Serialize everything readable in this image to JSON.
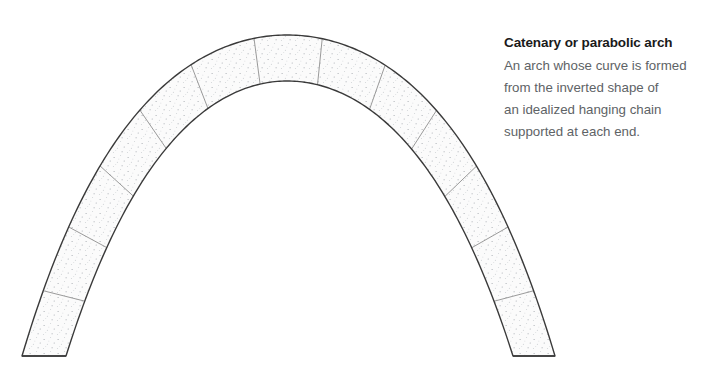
{
  "figure": {
    "name": "catenary-parabolic-arch-diagram",
    "background_color": "#ffffff"
  },
  "caption": {
    "title": "Catenary or parabolic arch",
    "title_color": "#1a1a1a",
    "body_color": "#5e6366",
    "body_lines": [
      "An arch whose curve is formed",
      "from the inverted shape of",
      "an idealized hanging chain",
      "supported at each end."
    ],
    "body_text": "An arch whose curve is formed from the inverted shape of an idealized hanging chain supported at each end."
  },
  "arch": {
    "label": "catenary-arch",
    "apex_x": 287,
    "extrados_apex_y": 35,
    "intrados_apex_y": 81,
    "left_outer_base_x": 22,
    "left_inner_base_x": 66,
    "right_inner_base_x": 513,
    "right_outer_base_x": 555,
    "springing_y": 356,
    "thickness_apex": 46,
    "voussoir_count": 13,
    "keystone_index": 6,
    "outline_color": "#3a3a3a",
    "outline_width": 1.4,
    "joint_color": "#8f8f8f",
    "joint_width": 0.9,
    "fill_color": "#fbfbfb",
    "stipple_color": "#9aa0a6",
    "stipple_density": 0.085,
    "curve_shape": "catenary",
    "catenary_a": 118
  }
}
